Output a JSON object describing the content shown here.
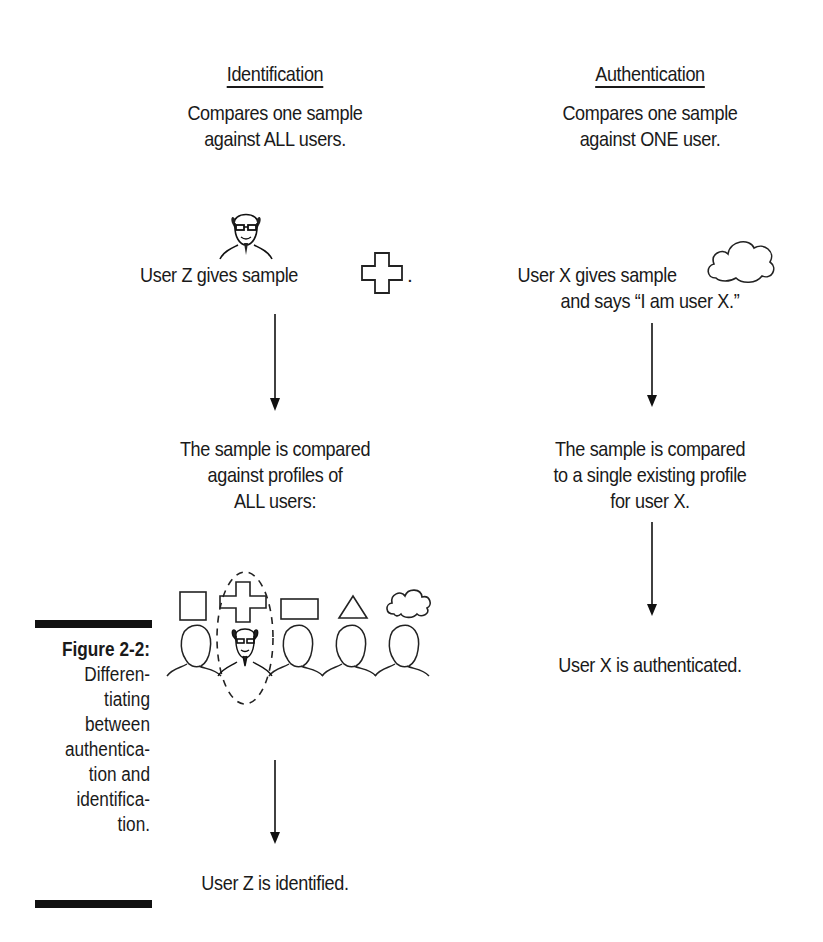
{
  "figure": {
    "label": "Figure 2-2:",
    "caption_lines": [
      "Differen-",
      "tiating",
      "between",
      "authentica-",
      "tion and",
      "identifica-",
      "tion."
    ]
  },
  "identification": {
    "heading": "Identification",
    "summary_lines": [
      "Compares one sample",
      "against ALL users."
    ],
    "step1_text": "User Z gives sample",
    "step1_suffix": ".",
    "step1_sample_icon": "cross-shape-icon",
    "step2_lines": [
      "The sample is compared",
      "against profiles of",
      "ALL users:"
    ],
    "profiles": [
      {
        "sample_icon": "square-shape-icon",
        "user_icon": "blank-head-icon"
      },
      {
        "sample_icon": "cross-shape-icon",
        "user_icon": "user-z-face-icon",
        "highlighted": true
      },
      {
        "sample_icon": "rectangle-shape-icon",
        "user_icon": "blank-head-icon"
      },
      {
        "sample_icon": "triangle-shape-icon",
        "user_icon": "blank-head-icon"
      },
      {
        "sample_icon": "cloud-shape-icon",
        "user_icon": "blank-head-icon"
      }
    ],
    "result": "User Z is identified."
  },
  "authentication": {
    "heading": "Authentication",
    "summary_lines": [
      "Compares one sample",
      "against ONE user."
    ],
    "step1_lines": [
      "User X gives sample",
      "and says “I am user X.”"
    ],
    "step1_sample_icon": "cloud-shape-icon",
    "step2_lines": [
      "The sample is compared",
      "to a single existing profile",
      "for user X."
    ],
    "result": "User X is authenticated."
  }
}
